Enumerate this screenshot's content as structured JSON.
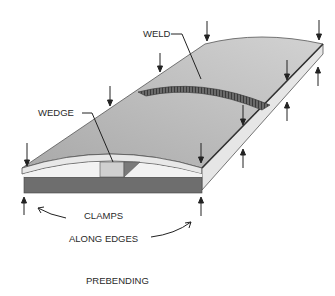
{
  "figure": {
    "title": "PREBENDING",
    "labels": {
      "weld": "WELD",
      "wedge": "WEDGE",
      "clamps": "CLAMPS",
      "along_edges": "ALONG EDGES"
    },
    "colors": {
      "plate_top": "#b9b9b9",
      "plate_top_far": "#cdcdcd",
      "plate_edge": "#e6e6e6",
      "base_bar": "#6e6e6e",
      "weld_bead": "#5a5a5a",
      "arrow": "#222222"
    }
  }
}
